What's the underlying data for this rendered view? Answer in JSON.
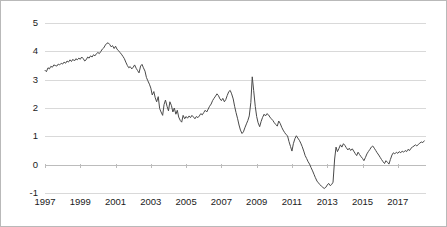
{
  "chart_data": {
    "type": "line",
    "title": "",
    "subtitle": "",
    "xlabel": "",
    "ylabel": "",
    "grid": true,
    "legend": "none",
    "xlim": [
      1997.0,
      2018.6
    ],
    "ylim": [
      -1,
      5
    ],
    "yticks": [
      5,
      4,
      3,
      2,
      1,
      0,
      -1
    ],
    "ytick_labels": [
      "5",
      "4",
      "3",
      "2",
      "1",
      "0",
      "-1"
    ],
    "xticks": [
      1997,
      1999,
      2001,
      2003,
      2005,
      2007,
      2009,
      2011,
      2013,
      2015,
      2017
    ],
    "xtick_labels": [
      "1997",
      "1999",
      "2001",
      "2003",
      "2005",
      "2007",
      "2009",
      "2011",
      "2013",
      "2015",
      "2017"
    ],
    "line_color": "#4a4a4a",
    "grid_color": "#d9d9d9",
    "series": [
      {
        "name": "series-1",
        "x": [
          1997.0,
          1997.08,
          1997.17,
          1997.25,
          1997.33,
          1997.42,
          1997.5,
          1997.58,
          1997.67,
          1997.75,
          1997.83,
          1997.92,
          1998.0,
          1998.08,
          1998.17,
          1998.25,
          1998.33,
          1998.42,
          1998.5,
          1998.58,
          1998.67,
          1998.75,
          1998.83,
          1998.92,
          1999.0,
          1999.08,
          1999.17,
          1999.25,
          1999.33,
          1999.42,
          1999.5,
          1999.58,
          1999.67,
          1999.75,
          1999.83,
          1999.92,
          2000.0,
          2000.08,
          2000.17,
          2000.25,
          2000.33,
          2000.42,
          2000.5,
          2000.58,
          2000.67,
          2000.75,
          2000.83,
          2000.92,
          2001.0,
          2001.08,
          2001.17,
          2001.25,
          2001.33,
          2001.42,
          2001.5,
          2001.58,
          2001.67,
          2001.75,
          2001.83,
          2001.92,
          2002.0,
          2002.08,
          2002.17,
          2002.25,
          2002.33,
          2002.42,
          2002.5,
          2002.58,
          2002.67,
          2002.75,
          2002.83,
          2002.92,
          2003.0,
          2003.08,
          2003.17,
          2003.25,
          2003.33,
          2003.42,
          2003.5,
          2003.58,
          2003.67,
          2003.75,
          2003.83,
          2003.92,
          2004.0,
          2004.08,
          2004.17,
          2004.25,
          2004.33,
          2004.42,
          2004.5,
          2004.58,
          2004.67,
          2004.75,
          2004.83,
          2004.92,
          2005.0,
          2005.08,
          2005.17,
          2005.25,
          2005.33,
          2005.42,
          2005.5,
          2005.58,
          2005.67,
          2005.75,
          2005.83,
          2005.92,
          2006.0,
          2006.08,
          2006.17,
          2006.25,
          2006.33,
          2006.42,
          2006.5,
          2006.58,
          2006.67,
          2006.75,
          2006.83,
          2006.92,
          2007.0,
          2007.08,
          2007.17,
          2007.25,
          2007.33,
          2007.42,
          2007.5,
          2007.58,
          2007.67,
          2007.75,
          2007.83,
          2007.92,
          2008.0,
          2008.08,
          2008.17,
          2008.25,
          2008.33,
          2008.42,
          2008.5,
          2008.58,
          2008.67,
          2008.75,
          2008.83,
          2008.92,
          2009.0,
          2009.08,
          2009.17,
          2009.25,
          2009.33,
          2009.42,
          2009.5,
          2009.58,
          2009.67,
          2009.75,
          2009.83,
          2009.92,
          2010.0,
          2010.08,
          2010.17,
          2010.25,
          2010.33,
          2010.42,
          2010.5,
          2010.58,
          2010.67,
          2010.75,
          2010.83,
          2010.92,
          2011.0,
          2011.08,
          2011.17,
          2011.25,
          2011.33,
          2011.42,
          2011.5,
          2011.58,
          2011.67,
          2011.75,
          2011.83,
          2011.92,
          2012.0,
          2012.08,
          2012.17,
          2012.25,
          2012.33,
          2012.42,
          2012.5,
          2012.58,
          2012.67,
          2012.75,
          2012.83,
          2012.92,
          2013.0,
          2013.08,
          2013.17,
          2013.25,
          2013.33,
          2013.42,
          2013.5,
          2013.58,
          2013.67,
          2013.75,
          2013.83,
          2013.92,
          2014.0,
          2014.08,
          2014.17,
          2014.25,
          2014.33,
          2014.42,
          2014.5,
          2014.58,
          2014.67,
          2014.75,
          2014.83,
          2014.92,
          2015.0,
          2015.08,
          2015.17,
          2015.25,
          2015.33,
          2015.42,
          2015.5,
          2015.58,
          2015.67,
          2015.75,
          2015.83,
          2015.92,
          2016.0,
          2016.08,
          2016.17,
          2016.25,
          2016.33,
          2016.42,
          2016.5,
          2016.58,
          2016.67,
          2016.75,
          2016.83,
          2016.92,
          2017.0,
          2017.08,
          2017.17,
          2017.25,
          2017.33,
          2017.42,
          2017.5,
          2017.58,
          2017.67,
          2017.75,
          2017.83,
          2017.92,
          2018.0,
          2018.08,
          2018.17,
          2018.25,
          2018.33,
          2018.42,
          2018.5
        ],
        "values": [
          3.33,
          3.28,
          3.42,
          3.38,
          3.47,
          3.44,
          3.52,
          3.5,
          3.48,
          3.55,
          3.52,
          3.58,
          3.55,
          3.62,
          3.58,
          3.66,
          3.62,
          3.7,
          3.64,
          3.72,
          3.66,
          3.74,
          3.7,
          3.76,
          3.72,
          3.8,
          3.74,
          3.66,
          3.7,
          3.8,
          3.76,
          3.84,
          3.8,
          3.88,
          3.84,
          3.92,
          3.96,
          3.92,
          4.0,
          4.08,
          4.12,
          4.22,
          4.28,
          4.3,
          4.24,
          4.16,
          4.2,
          4.1,
          4.18,
          4.08,
          4.02,
          3.96,
          3.9,
          3.82,
          3.74,
          3.62,
          3.5,
          3.42,
          3.46,
          3.38,
          3.44,
          3.52,
          3.4,
          3.32,
          3.24,
          3.48,
          3.54,
          3.42,
          3.3,
          3.08,
          2.96,
          2.84,
          2.7,
          2.46,
          2.58,
          2.36,
          2.22,
          2.4,
          1.98,
          1.86,
          1.74,
          2.12,
          2.28,
          2.06,
          1.9,
          2.22,
          2.08,
          1.86,
          2.0,
          1.78,
          1.92,
          1.68,
          1.56,
          1.5,
          1.74,
          1.62,
          1.7,
          1.64,
          1.72,
          1.66,
          1.74,
          1.68,
          1.62,
          1.7,
          1.66,
          1.72,
          1.8,
          1.76,
          1.84,
          1.92,
          1.86,
          1.96,
          2.06,
          2.14,
          2.26,
          2.34,
          2.42,
          2.5,
          2.44,
          2.32,
          2.26,
          2.34,
          2.22,
          2.3,
          2.44,
          2.58,
          2.62,
          2.5,
          2.32,
          2.06,
          1.84,
          1.62,
          1.4,
          1.22,
          1.1,
          1.16,
          1.3,
          1.44,
          1.56,
          1.72,
          2.2,
          3.1,
          2.62,
          2.06,
          1.7,
          1.48,
          1.34,
          1.52,
          1.66,
          1.78,
          1.72,
          1.8,
          1.76,
          1.68,
          1.62,
          1.56,
          1.48,
          1.42,
          1.36,
          1.54,
          1.46,
          1.32,
          1.22,
          1.14,
          1.06,
          1.02,
          0.82,
          0.64,
          0.48,
          0.74,
          0.92,
          1.02,
          0.94,
          0.86,
          0.76,
          0.64,
          0.48,
          0.32,
          0.22,
          0.1,
          0.02,
          -0.1,
          -0.22,
          -0.34,
          -0.46,
          -0.58,
          -0.64,
          -0.7,
          -0.76,
          -0.8,
          -0.84,
          -0.8,
          -0.72,
          -0.66,
          -0.74,
          -0.7,
          -0.62,
          0.2,
          0.62,
          0.46,
          0.58,
          0.7,
          0.62,
          0.74,
          0.68,
          0.6,
          0.52,
          0.58,
          0.5,
          0.56,
          0.48,
          0.4,
          0.32,
          0.44,
          0.36,
          0.28,
          0.22,
          0.14,
          0.26,
          0.38,
          0.46,
          0.54,
          0.62,
          0.66,
          0.58,
          0.5,
          0.42,
          0.34,
          0.26,
          0.18,
          0.1,
          0.04,
          0.14,
          0.08,
          0.02,
          0.18,
          0.34,
          0.42,
          0.38,
          0.44,
          0.4,
          0.46,
          0.42,
          0.48,
          0.44,
          0.5,
          0.46,
          0.54,
          0.5,
          0.58,
          0.62,
          0.66,
          0.7,
          0.66,
          0.72,
          0.76,
          0.8,
          0.78,
          0.84
        ]
      }
    ]
  }
}
